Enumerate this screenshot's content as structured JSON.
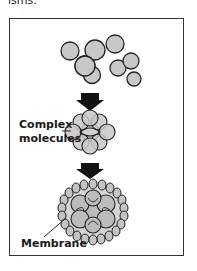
{
  "header": {
    "text": "isms."
  },
  "figure": {
    "labels": {
      "complex": "Complex\nmolecules",
      "complex_line1": "Complex",
      "complex_line2": "molecules",
      "membrane": "Membrane"
    },
    "stages": [
      "Simple molecules",
      "Complex molecules",
      "Membrane"
    ],
    "colors": {
      "molecule_fill": "#c8c8c8",
      "stroke": "#222222",
      "arrow": "#111111",
      "frame": "#333333"
    }
  }
}
